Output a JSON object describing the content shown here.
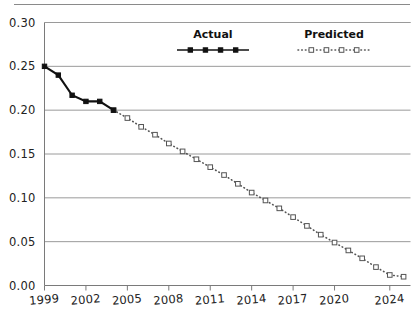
{
  "chart_data": {
    "type": "line",
    "title": "",
    "xlabel": "",
    "ylabel": "",
    "xlim": [
      1999,
      2025.5
    ],
    "ylim": [
      0.0,
      0.3
    ],
    "grid": "horizontal",
    "legend_position": "top-inside",
    "y_ticks": [
      0.0,
      0.05,
      0.1,
      0.15,
      0.2,
      0.25,
      0.3
    ],
    "y_tick_labels": [
      "0.00",
      "0.05",
      "0.10",
      "0.15",
      "0.20",
      "0.25",
      "0.30"
    ],
    "x_ticks": [
      1999,
      2002,
      2005,
      2008,
      2011,
      2014,
      2017,
      2020,
      2024
    ],
    "x_tick_labels": [
      "1999",
      "2002",
      "2005",
      "2008",
      "2011",
      "2014",
      "2017",
      "2020",
      "2024"
    ],
    "series": [
      {
        "name": "Actual",
        "style": "solid",
        "marker": "filled-square",
        "color": "#111111",
        "x": [
          1999,
          2000,
          2001,
          2002,
          2003,
          2004
        ],
        "values": [
          0.25,
          0.24,
          0.217,
          0.21,
          0.21,
          0.2
        ]
      },
      {
        "name": "Predicted",
        "style": "dotted",
        "marker": "open-square",
        "color": "#555555",
        "x": [
          2004,
          2005,
          2006,
          2007,
          2008,
          2009,
          2010,
          2011,
          2012,
          2013,
          2014,
          2015,
          2016,
          2017,
          2018,
          2019,
          2020,
          2021,
          2022,
          2023,
          2024,
          2025
        ],
        "values": [
          0.2,
          0.191,
          0.181,
          0.172,
          0.162,
          0.153,
          0.144,
          0.135,
          0.126,
          0.116,
          0.106,
          0.097,
          0.088,
          0.078,
          0.068,
          0.058,
          0.049,
          0.04,
          0.031,
          0.021,
          0.012,
          0.01
        ]
      }
    ]
  },
  "legend": {
    "entries": [
      {
        "label": "Actual"
      },
      {
        "label": "Predicted"
      }
    ]
  },
  "colors": {
    "actual": "#111111",
    "predicted": "#555555",
    "grid": "#9a9a9a",
    "axis": "#7a7a7a",
    "text": "#222222"
  }
}
